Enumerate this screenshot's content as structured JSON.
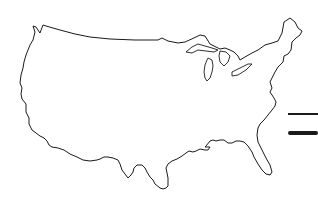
{
  "map": {
    "region": "United States (contiguous)",
    "style": "outline",
    "stroke_color": "#1a1a1a",
    "background": "#ffffff"
  },
  "legend": {
    "items": [
      {
        "style": "thin-line",
        "color": "#1a1a1a"
      },
      {
        "style": "thick-line",
        "color": "#1a1a1a"
      }
    ]
  }
}
